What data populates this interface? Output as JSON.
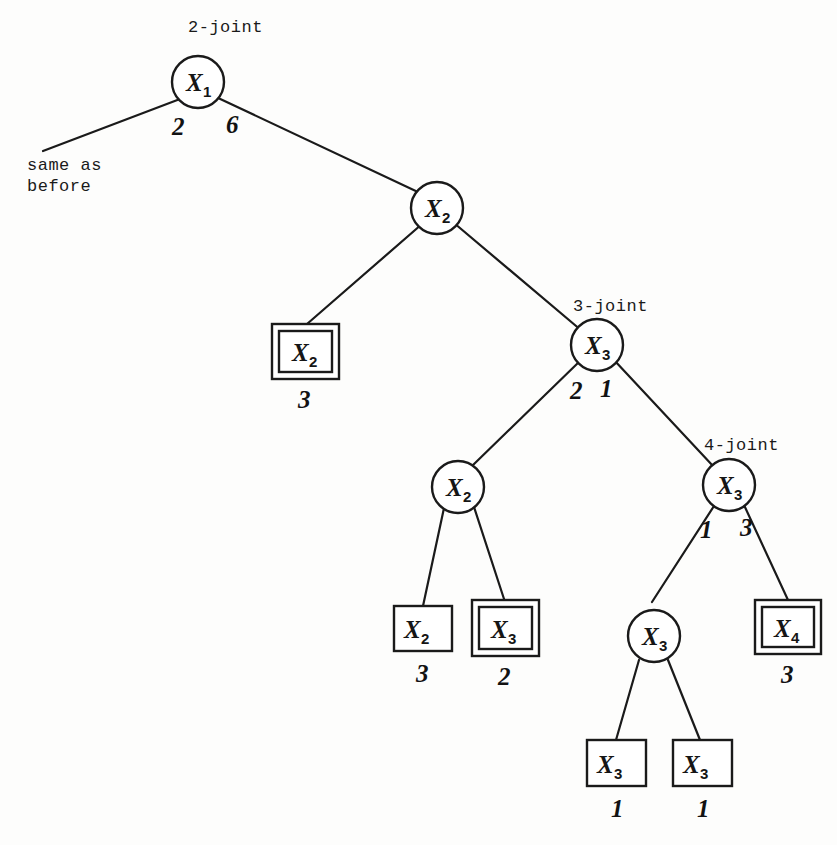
{
  "diagram": {
    "background_color": "#fdfdfc",
    "ink_color": "#1a1a1a",
    "annotations": {
      "joint2": "2-joint",
      "joint3": "3-joint",
      "joint4": "4-joint",
      "same_as_line1": "same as",
      "same_as_line2": "before"
    },
    "nodes": {
      "root": {
        "var": "X",
        "sub": "1"
      },
      "x2_top": {
        "var": "X",
        "sub": "2"
      },
      "x3_joint3": {
        "var": "X",
        "sub": "3"
      },
      "x2_mid": {
        "var": "X",
        "sub": "2"
      },
      "x3_joint4": {
        "var": "X",
        "sub": "3"
      },
      "x3_low": {
        "var": "X",
        "sub": "3"
      }
    },
    "leaves": {
      "leaf_x2_a": {
        "var": "X",
        "sub": "2",
        "count": "3",
        "double_border": true
      },
      "leaf_x2_b": {
        "var": "X",
        "sub": "2",
        "count": "3",
        "double_border": false
      },
      "leaf_x3_a": {
        "var": "X",
        "sub": "3",
        "count": "2",
        "double_border": true
      },
      "leaf_x3_b": {
        "var": "X",
        "sub": "3",
        "count": "1",
        "double_border": false
      },
      "leaf_x3_c": {
        "var": "X",
        "sub": "3",
        "count": "1",
        "double_border": false
      },
      "leaf_x4": {
        "var": "X",
        "sub": "4",
        "count": "3",
        "double_border": true
      }
    },
    "edge_weights": {
      "root_left": "2",
      "root_right": "6",
      "joint3_left": "2",
      "joint3_right": "1",
      "joint4_left": "1",
      "joint4_right": "3"
    }
  }
}
